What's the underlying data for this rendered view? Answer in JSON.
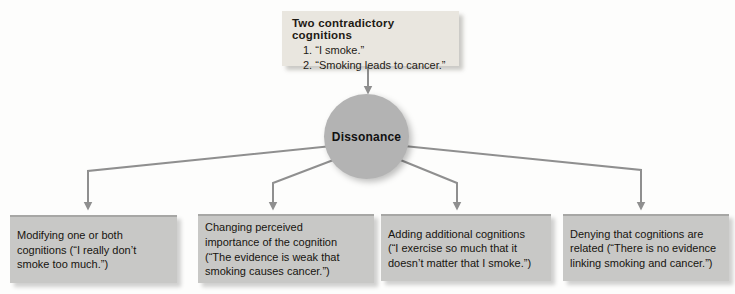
{
  "diagram": {
    "top_box": {
      "title": "Two contradictory cognitions",
      "items": [
        "1. “I smoke.”",
        "2. “Smoking leads to cancer.”"
      ]
    },
    "center_node": {
      "label": "Dissonance"
    },
    "strategies": [
      {
        "name": "modifying-cognitions",
        "lines": [
          "Modifying one or both",
          "cognitions (“I really don’t",
          "smoke too much.”)"
        ]
      },
      {
        "name": "changing-perceived-importance",
        "lines": [
          "Changing perceived",
          "importance of the cognition",
          "(“The evidence is weak that",
          "smoking causes cancer.”)"
        ]
      },
      {
        "name": "adding-additional-cognitions",
        "lines": [
          "Adding additional cognitions",
          "(“I exercise so much that it",
          "doesn’t matter that I smoke.”)"
        ]
      },
      {
        "name": "denying-cognitions-related",
        "lines": [
          "Denying that cognitions are",
          "related (“There is no evidence",
          "linking smoking and cancer.”)"
        ]
      }
    ],
    "colors": {
      "top_box_bg": "#e9e6df",
      "node_bg": "#b3b3b3",
      "strategy_box_bg": "#c8c8c6",
      "strategy_box_top_edge": "#a7a7a5",
      "arrow": "#8f8f8f",
      "text": "#17140f",
      "background": "#fdfdfc"
    }
  }
}
